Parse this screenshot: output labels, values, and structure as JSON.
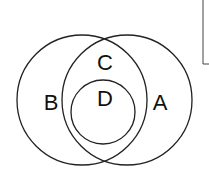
{
  "diagram": {
    "type": "venn",
    "sets": [
      {
        "id": "B",
        "label": "B",
        "cx": 82,
        "cy": 100,
        "r": 65
      },
      {
        "id": "A",
        "label": "A",
        "cx": 127,
        "cy": 100,
        "r": 65
      },
      {
        "id": "D",
        "label": "D",
        "cx": 103,
        "cy": 112,
        "r": 32
      }
    ],
    "region_labels": {
      "C": "C",
      "B": "B",
      "D": "D",
      "A": "A"
    },
    "stroke_color": "#222222",
    "background": "#ffffff"
  }
}
